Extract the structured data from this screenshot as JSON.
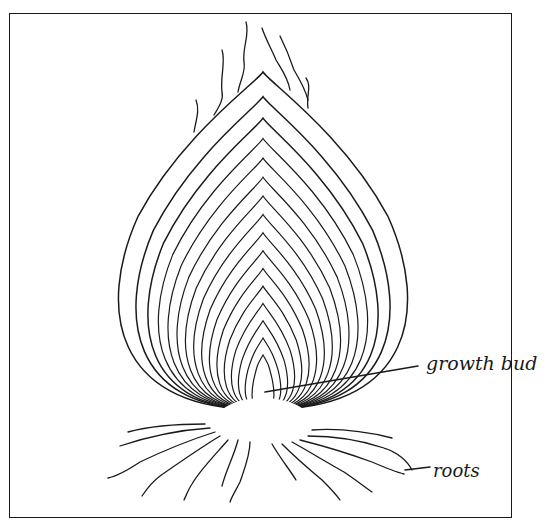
{
  "figure": {
    "labels": {
      "growth_bud": "growth bud",
      "roots": "roots"
    },
    "colors": {
      "ink": "#1a1a1a",
      "background": "#ffffff"
    },
    "bulb": {
      "apex_x": 263,
      "base_y": 415,
      "basal_plate": {
        "cx": 263,
        "cy": 418,
        "rx": 52,
        "ry": 30
      },
      "scale_count": 16,
      "outer_top_y": 72,
      "outer_half_width": 160,
      "inner_top_y": 355,
      "inner_half_width": 12
    },
    "leaders": {
      "growth_bud": {
        "x1": 265,
        "y1": 392,
        "x2": 418,
        "y2": 366
      },
      "roots": {
        "x1": 405,
        "y1": 470,
        "x2": 430,
        "y2": 467
      }
    }
  }
}
